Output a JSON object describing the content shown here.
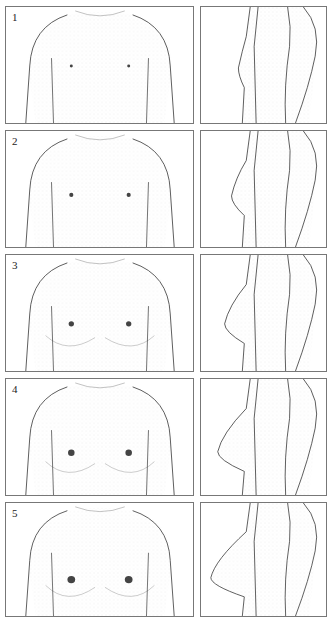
{
  "figure": {
    "stages": [
      {
        "label": "1",
        "bust": 0
      },
      {
        "label": "2",
        "bust": 1
      },
      {
        "label": "3",
        "bust": 2
      },
      {
        "label": "4",
        "bust": 3
      },
      {
        "label": "5",
        "bust": 4
      }
    ]
  },
  "colors": {
    "line": "#333333",
    "border": "#777777",
    "stipple": "#999999"
  }
}
